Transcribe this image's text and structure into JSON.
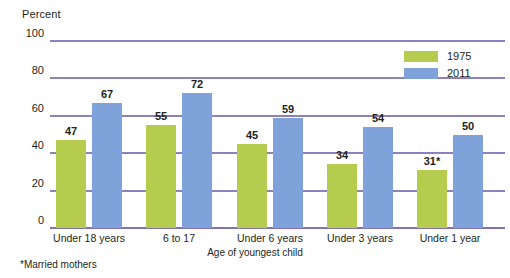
{
  "chart_data": {
    "type": "bar",
    "title": "",
    "ylabel": "Percent",
    "xlabel": "Age of youngest child",
    "categories": [
      "Under 18 years",
      "6 to 17",
      "Under 6 years",
      "Under 3 years",
      "Under 1 year"
    ],
    "series": [
      {
        "name": "1975",
        "color": "#b6cc4e",
        "values": [
          47,
          55,
          45,
          34,
          31
        ],
        "labels": [
          "47",
          "55",
          "45",
          "34",
          "31*"
        ]
      },
      {
        "name": "2011",
        "color": "#7fa2db",
        "values": [
          67,
          72,
          59,
          54,
          50
        ],
        "labels": [
          "67",
          "72",
          "59",
          "54",
          "50"
        ]
      }
    ],
    "ylim": [
      0,
      100
    ],
    "yticks": [
      0,
      20,
      40,
      60,
      80,
      100
    ],
    "ytick_labels": [
      "0",
      "20",
      "40",
      "60",
      "80",
      "100"
    ],
    "grid": true,
    "grid_color": "#8c80c0",
    "legend_position": "top-right",
    "footnote": "*Married mothers"
  },
  "legend": {
    "entries": [
      {
        "label": "1975"
      },
      {
        "label": "2011"
      }
    ]
  }
}
